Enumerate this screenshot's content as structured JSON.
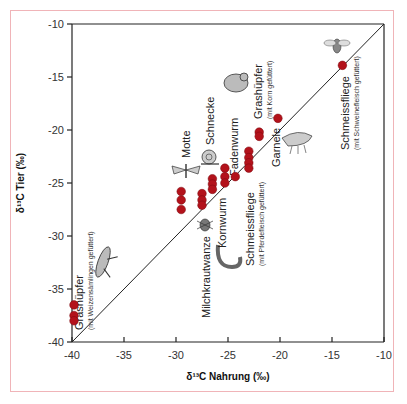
{
  "chart_data": {
    "type": "scatter",
    "title": "",
    "xlabel": "δ13C Nahrung (‰)",
    "ylabel": "δ13C Tier (‰)",
    "xlim": [
      -40,
      -10
    ],
    "ylim": [
      -40,
      -10
    ],
    "x_ticks": [
      -40,
      -35,
      -30,
      -25,
      -20,
      -15,
      -10
    ],
    "y_ticks": [
      -40,
      -35,
      -30,
      -25,
      -20,
      -15,
      -10
    ],
    "x_tick_labels": [
      "-40",
      "-35",
      "-30",
      "-25",
      "-20",
      "-15",
      "-10"
    ],
    "y_tick_labels": [
      "-40",
      "-35",
      "-30",
      "-25",
      "-20",
      "-15",
      "-10"
    ],
    "grid": false,
    "legend": null,
    "reference_line": {
      "label": "1:1",
      "from": [
        -40,
        -40
      ],
      "to": [
        -10,
        -10
      ]
    },
    "marker_color": "#b3121b",
    "series": [
      {
        "name": "Grashüpfer (mit Weizensämlingen gefüttert)",
        "points": [
          [
            -40,
            -36.5
          ],
          [
            -40,
            -37.5
          ],
          [
            -40,
            -38.0
          ]
        ]
      },
      {
        "name": "Motte",
        "points": [
          [
            -29.5,
            -25.8
          ],
          [
            -29.5,
            -26.6
          ],
          [
            -29.5,
            -27.5
          ]
        ]
      },
      {
        "name": "Milchkrautwanze",
        "points": [
          [
            -27.5,
            -26.0
          ],
          [
            -27.5,
            -26.6
          ],
          [
            -27.5,
            -27.1
          ]
        ]
      },
      {
        "name": "Kornwurm",
        "points": [
          [
            -26.5,
            -24.6
          ],
          [
            -26.5,
            -25.1
          ],
          [
            -26.5,
            -25.6
          ]
        ]
      },
      {
        "name": "Fadenwurm",
        "points": [
          [
            -25.3,
            -23.6
          ],
          [
            -25.3,
            -24.4
          ],
          [
            -25.3,
            -25.0
          ],
          [
            -24.3,
            -24.4
          ]
        ]
      },
      {
        "name": "Schmeissfliege (mit Pferdefleisch gefüttert)",
        "points": [
          [
            -23.0,
            -22.0
          ],
          [
            -23.0,
            -22.6
          ],
          [
            -23.0,
            -23.1
          ],
          [
            -23.0,
            -23.6
          ]
        ]
      },
      {
        "name": "Grashüpfer (mit Korn gefüttert)",
        "points": [
          [
            -22.0,
            -20.2
          ],
          [
            -22.0,
            -20.6
          ]
        ]
      },
      {
        "name": "Garnele",
        "points": [
          [
            -20.2,
            -18.9
          ]
        ]
      },
      {
        "name": "Schmeissfliege (mit Schweinefleisch gefüttert)",
        "points": [
          [
            -14.0,
            -13.9
          ]
        ]
      }
    ],
    "annotations": [
      {
        "text": "Grashüpfer",
        "sub": "(mit Weizensämlingen gefüttert)"
      },
      {
        "text": "Motte"
      },
      {
        "text": "Schnecke"
      },
      {
        "text": "Milchkrautwanze"
      },
      {
        "text": "Kornwurm"
      },
      {
        "text": "Fadenwurm"
      },
      {
        "text": "Schmeissfliege",
        "sub": "(mit Pferdefleisch gefüttert)"
      },
      {
        "text": "Grashüpfer",
        "sub": "(mit Korn gefüttert)"
      },
      {
        "text": "Garnele"
      },
      {
        "text": "Schmeissfliege",
        "sub": "(mit Schweinefleisch gefüttert)"
      }
    ]
  },
  "labels": {
    "xlabel": "δ¹³C Nahrung (‰)",
    "ylabel": "δ¹³C Tier (‰)",
    "grashuepfer_weizen": "Grashüpfer",
    "grashuepfer_weizen_sub": "(mit Weizensämlingen gefüttert)",
    "motte": "Motte",
    "schnecke": "Schnecke",
    "milchkrautwanze": "Milchkrautwanze",
    "kornwurm": "Kornwurm",
    "fadenwurm": "Fadenwurm",
    "schmeissfliege_pferd": "Schmeissfliege",
    "schmeissfliege_pferd_sub": "(mit Pferdefleisch gefüttert)",
    "grashuepfer_korn": "Grashüpfer",
    "grashuepfer_korn_sub": "(mit Korn gefüttert)",
    "garnele": "Garnele",
    "schmeissfliege_schwein": "Schmeissfliege",
    "schmeissfliege_schwein_sub": "(mit Schweinefleisch gefüttert)"
  },
  "ticks": {
    "x": [
      "-40",
      "-35",
      "-30",
      "-25",
      "-20",
      "-15",
      "-10"
    ],
    "y": [
      "-40",
      "-35",
      "-30",
      "-25",
      "-20",
      "-15",
      "-10"
    ]
  }
}
